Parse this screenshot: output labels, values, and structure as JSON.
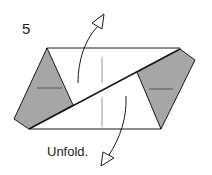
{
  "diagram": {
    "step_number": "5",
    "caption": "Unfold.",
    "colors": {
      "shaded": "#a6a6a6",
      "line": "#1a1a1a",
      "crease": "#9a9a9a",
      "paper": "#ffffff"
    }
  }
}
